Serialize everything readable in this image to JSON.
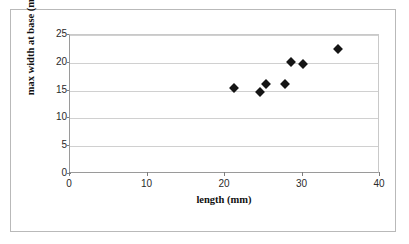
{
  "chart_data": {
    "type": "scatter",
    "title": "",
    "xlabel": "length (mm)",
    "ylabel": "max width at base (mm)",
    "xlim": [
      0,
      40
    ],
    "ylim": [
      0,
      25
    ],
    "xticks": [
      0,
      10,
      20,
      30,
      40
    ],
    "yticks": [
      0,
      5,
      10,
      15,
      20,
      25
    ],
    "grid": "horizontal",
    "legend": "none",
    "marker": "filled-diamond",
    "marker_color": "#151515",
    "points": [
      {
        "x": 21.2,
        "y": 15.5
      },
      {
        "x": 24.5,
        "y": 14.8
      },
      {
        "x": 25.3,
        "y": 16.2
      },
      {
        "x": 27.7,
        "y": 16.2
      },
      {
        "x": 28.5,
        "y": 20.2
      },
      {
        "x": 30.1,
        "y": 19.8
      },
      {
        "x": 34.6,
        "y": 22.4
      }
    ]
  },
  "figure": {
    "border_color": "#b9b9b9",
    "background": "#ffffff",
    "gridline_color": "#d0d0d0",
    "axis_color": "#9a9a9a"
  }
}
